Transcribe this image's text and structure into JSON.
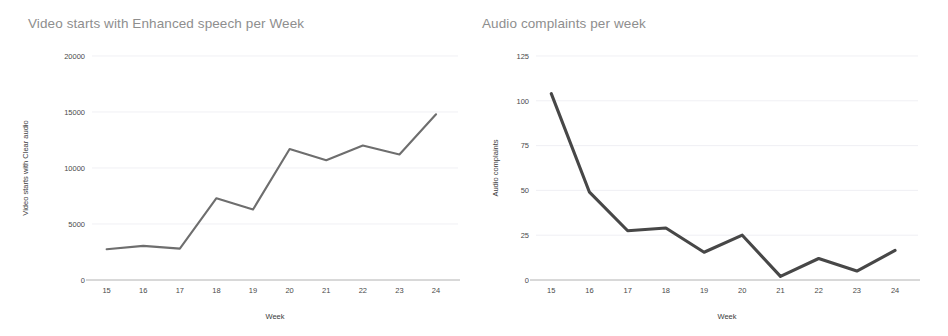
{
  "charts": [
    {
      "id": "video-starts-enhanced-speech",
      "title": "Video starts with Enhanced speech per Week",
      "line_color": "#6e6e6e",
      "chart_data": {
        "type": "line",
        "title": "Video starts with Enhanced speech per Week",
        "xlabel": "Week",
        "ylabel": "Video starts with Clear audio",
        "categories": [
          15,
          16,
          17,
          18,
          19,
          20,
          21,
          22,
          23,
          24
        ],
        "x_tick_labels": [
          "15",
          "16",
          "17",
          "18",
          "19",
          "20",
          "21",
          "22",
          "23",
          "24"
        ],
        "y_tick_labels": [
          "0",
          "5000",
          "10000",
          "15000",
          "20000"
        ],
        "y_ticks": [
          0,
          5000,
          10000,
          15000,
          20000
        ],
        "ylim": [
          0,
          20000
        ],
        "xlim": [
          14.6,
          24.6
        ],
        "grid": true,
        "legend": "none",
        "series": [
          {
            "name": "Video starts with Clear audio",
            "values": [
              2750,
              3050,
              2800,
              7300,
              6300,
              11700,
              10700,
              12000,
              11200,
              14800
            ]
          }
        ]
      }
    },
    {
      "id": "audio-complaints",
      "title": "Audio complaints per week",
      "line_color": "#474747",
      "chart_data": {
        "type": "line",
        "title": "Audio complaints per week",
        "xlabel": "Week",
        "ylabel": "Audio complaints",
        "categories": [
          15,
          16,
          17,
          18,
          19,
          20,
          21,
          22,
          23,
          24
        ],
        "x_tick_labels": [
          "15",
          "16",
          "17",
          "18",
          "19",
          "20",
          "21",
          "22",
          "23",
          "24"
        ],
        "y_tick_labels": [
          "0",
          "25",
          "50",
          "75",
          "100",
          "125"
        ],
        "y_ticks": [
          0,
          25,
          50,
          75,
          100,
          125
        ],
        "ylim": [
          0,
          125
        ],
        "xlim": [
          14.6,
          24.6
        ],
        "grid": true,
        "legend": "none",
        "series": [
          {
            "name": "Audio complaints",
            "values": [
              104,
              49,
              27.5,
              29,
              15.5,
              25,
              2,
              12,
              5,
              16.5
            ]
          }
        ]
      }
    }
  ]
}
